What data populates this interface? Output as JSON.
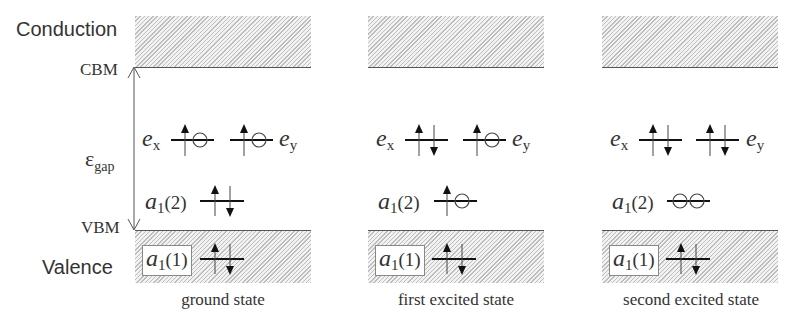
{
  "side_labels": {
    "conduction": "Conduction",
    "cbm": "CBM",
    "gap_symbol": "ε",
    "gap_subscript": "gap",
    "vbm": "VBM",
    "valence": "Valence"
  },
  "orbitals": {
    "e": "e",
    "x": "x",
    "y": "y",
    "a": "a",
    "sub1": "1",
    "level2": "(2)",
    "level1": "(1)"
  },
  "panels": [
    {
      "caption": "ground state",
      "occupancy": {
        "a1_1": [
          "up",
          "down"
        ],
        "a1_2": [
          "up",
          "down"
        ],
        "e_x": [
          "up",
          "empty"
        ],
        "e_y": [
          "up",
          "empty"
        ]
      }
    },
    {
      "caption": "first excited state",
      "occupancy": {
        "a1_1": [
          "up",
          "down"
        ],
        "a1_2": [
          "up",
          "empty"
        ],
        "e_x": [
          "up",
          "down"
        ],
        "e_y": [
          "up",
          "empty"
        ]
      }
    },
    {
      "caption": "second excited state",
      "occupancy": {
        "a1_1": [
          "up",
          "down"
        ],
        "a1_2": [
          "empty",
          "empty"
        ],
        "e_x": [
          "up",
          "down"
        ],
        "e_y": [
          "up",
          "down"
        ]
      }
    }
  ],
  "colors": {
    "hatch": "#bdbdbd",
    "band_edge": "#555555",
    "text": "#333333",
    "level_line": "#111111"
  }
}
